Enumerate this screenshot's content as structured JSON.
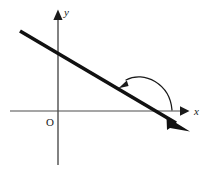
{
  "figure": {
    "background_color": "#ffffff",
    "width": 208,
    "height": 171
  },
  "axes": {
    "x_axis": {
      "label": "x",
      "color": "#4d4d4d",
      "stroke_width": 1.1,
      "start": {
        "x": 10,
        "y": 111
      },
      "end": {
        "x": 186,
        "y": 111
      },
      "arrow": "right"
    },
    "y_axis": {
      "label": "y",
      "color": "#4d4d4d",
      "stroke_width": 1.4,
      "start": {
        "x": 58,
        "y": 165
      },
      "end": {
        "x": 58,
        "y": 12
      },
      "arrow": "up"
    },
    "origin": {
      "label": "O",
      "x": 58,
      "y": 111
    }
  },
  "line": {
    "name": "inclined-line",
    "color": "#111111",
    "stroke_width": 3.6,
    "start": {
      "x": 20,
      "y": 31
    },
    "end": {
      "x": 188,
      "y": 130
    },
    "arrow": "end",
    "slope_sign": "negative",
    "x_intercept": {
      "x": 152,
      "y": 111
    },
    "y_intercept": {
      "x": 58,
      "y": 53
    }
  },
  "angle_arc": {
    "name": "inclination-angle-arc",
    "color": "#1a1a1a",
    "stroke_width": 1.2,
    "label": "",
    "from": {
      "x": 172,
      "y": 111
    },
    "to": {
      "x": 120,
      "y": 87
    },
    "apex": {
      "x": 146,
      "y": 76
    },
    "direction": "counterclockwise",
    "arrow": "end"
  },
  "colors": {
    "ink": "#111111",
    "axis": "#4d4d4d",
    "background": "#ffffff"
  }
}
